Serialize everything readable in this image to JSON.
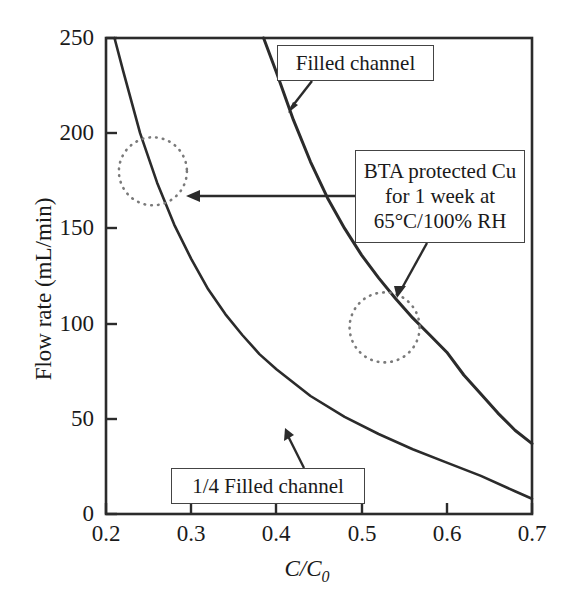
{
  "figure": {
    "type": "scientific-line-plot",
    "background": "#ffffff",
    "line_color": "#2b2b2b",
    "marker_color": "#6e6e6e"
  },
  "axes": {
    "x": {
      "label": "C/C",
      "label_sub": "0",
      "label_full": "C/C0",
      "ticks": [
        "0.2",
        "0.3",
        "0.4",
        "0.5",
        "0.6",
        "0.7"
      ],
      "tick_values": [
        0.2,
        0.3,
        0.4,
        0.5,
        0.6,
        0.7
      ],
      "range": [
        0.2,
        0.7
      ]
    },
    "y": {
      "label": "Flow rate (mL/min)",
      "ticks": [
        "0",
        "50",
        "100",
        "150",
        "200",
        "250"
      ],
      "tick_values": [
        0,
        50,
        100,
        150,
        200,
        250
      ],
      "range": [
        0,
        250
      ]
    }
  },
  "annotations": {
    "filled": {
      "text": "Filled channel"
    },
    "bta": {
      "line1": "BTA protected Cu",
      "line2": "for 1 week at",
      "line3": "65°C/100% RH"
    },
    "quarter": {
      "text": "1/4 Filled channel"
    }
  },
  "chart_data": {
    "type": "line",
    "title": "",
    "xlabel": "C/C0",
    "ylabel": "Flow rate (mL/min)",
    "xlim": [
      0.2,
      0.7
    ],
    "ylim": [
      0,
      250
    ],
    "grid": false,
    "legend": "annotated-callouts",
    "series": [
      {
        "name": "Filled channel",
        "x": [
          0.385,
          0.4,
          0.42,
          0.44,
          0.46,
          0.48,
          0.5,
          0.52,
          0.54,
          0.56,
          0.58,
          0.6,
          0.62,
          0.64,
          0.66,
          0.68,
          0.7
        ],
        "y": [
          250,
          232,
          207,
          185,
          166,
          150,
          136,
          124,
          113,
          103,
          94,
          85,
          73,
          63,
          53,
          44,
          37
        ]
      },
      {
        "name": "1/4 Filled channel",
        "x": [
          0.21,
          0.22,
          0.24,
          0.26,
          0.28,
          0.3,
          0.32,
          0.34,
          0.36,
          0.38,
          0.4,
          0.44,
          0.48,
          0.52,
          0.56,
          0.6,
          0.64,
          0.68,
          0.7
        ],
        "y": [
          250,
          233,
          200,
          174,
          152,
          134,
          118,
          105,
          94,
          84,
          76,
          62,
          51,
          42,
          34,
          27,
          20,
          12,
          8
        ]
      }
    ],
    "markers": [
      {
        "name": "intersection-region-1",
        "cx": 0.255,
        "cy": 180,
        "r_px": 34,
        "style": "dotted-circle"
      },
      {
        "name": "intersection-region-2",
        "cx": 0.527,
        "cy": 98,
        "r_px": 35,
        "style": "dotted-circle"
      }
    ],
    "callouts": [
      {
        "label": "Filled channel",
        "points_to": "filled-channel-curve"
      },
      {
        "label": "BTA protected Cu for 1 week at 65°C/100% RH",
        "points_to": "intersection-regions"
      },
      {
        "label": "1/4 Filled channel",
        "points_to": "quarter-filled-channel-curve"
      }
    ]
  }
}
